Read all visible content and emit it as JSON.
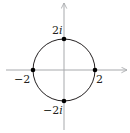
{
  "diagram": {
    "type": "complex-plane-circle",
    "colors": {
      "axis": "#a7a9ac",
      "circle": "#231f20",
      "point": "#000000",
      "text": "#231f20"
    },
    "axes": {
      "horizontal": {
        "from": [
          6,
          70
        ],
        "to": [
          127,
          70
        ],
        "arrow": true
      },
      "vertical": {
        "from": [
          64,
          130
        ],
        "to": [
          64,
          3
        ],
        "arrow": true
      }
    },
    "circle": {
      "cx": 64,
      "cy": 70,
      "r": 31
    },
    "points": [
      {
        "name": "top",
        "value": "2i",
        "x": 64,
        "y": 39
      },
      {
        "name": "bottom",
        "value": "-2i",
        "x": 64,
        "y": 101
      },
      {
        "name": "left",
        "value": "-2",
        "x": 33,
        "y": 70
      },
      {
        "name": "right",
        "value": "2",
        "x": 95,
        "y": 70
      }
    ],
    "labels": {
      "top": {
        "num": "2",
        "imag": "i"
      },
      "bottom": {
        "num": "−2",
        "imag": "i"
      },
      "left": {
        "text": "−2"
      },
      "right": {
        "text": "2"
      }
    }
  }
}
